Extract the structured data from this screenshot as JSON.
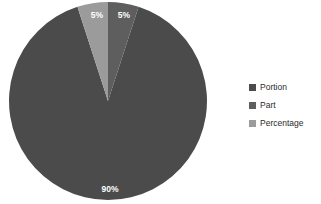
{
  "chart_data": {
    "type": "pie",
    "title": "",
    "subtitle": "",
    "xlabel": "",
    "ylabel": "",
    "grid": false,
    "legend_position": "right",
    "categories": [
      "Portion",
      "Part",
      "Percentage"
    ],
    "values": [
      90,
      5,
      5
    ],
    "data_labels": [
      "90%",
      "5%",
      "5%"
    ],
    "colors": [
      "#4b4b4b",
      "#5e5e5e",
      "#9b9b9b"
    ],
    "slices": [
      {
        "name": "Portion",
        "value": 90,
        "label": "90%",
        "color": "#4b4b4b",
        "start_angle": 18,
        "end_angle": 342,
        "label_x": 110,
        "label_y": 192
      },
      {
        "name": "Part",
        "value": 5,
        "label": "5%",
        "color": "#5e5e5e",
        "start_angle": 0,
        "end_angle": 18,
        "label_x": 124,
        "label_y": 18
      },
      {
        "name": "Percentage",
        "value": 5,
        "label": "5%",
        "color": "#9b9b9b",
        "start_angle": 342,
        "end_angle": 360,
        "label_x": 97,
        "label_y": 18
      }
    ],
    "geometry": {
      "center_x": 108,
      "center_y": 101,
      "radius": 99
    }
  },
  "legend": {
    "items": [
      {
        "label": "Portion",
        "color": "#4b4b4b"
      },
      {
        "label": "Part",
        "color": "#5e5e5e"
      },
      {
        "label": "Percentage",
        "color": "#9b9b9b"
      }
    ]
  },
  "background_color": "#ffffff"
}
